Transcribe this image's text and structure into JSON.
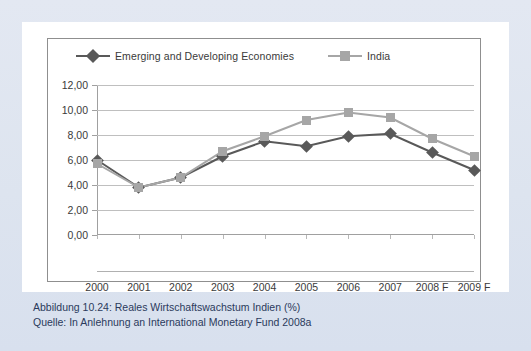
{
  "figure": {
    "caption_line1": "Abbildung 10.24:  Reales Wirtschaftswachstum Indien (%)",
    "caption_line2": "Quelle: In Anlehnung an International Monetary Fund 2008a"
  },
  "colors": {
    "series_emerging": "#595959",
    "series_india": "#a6a6a6",
    "gridline": "#bfbfbf",
    "axis": "#a0a0a0",
    "page_background": "#dfe5f0",
    "card_background": "#ffffff",
    "caption_text": "#2b3a5c"
  },
  "chart_data": {
    "type": "line",
    "title": "",
    "xlabel": "",
    "ylabel": "",
    "ylim": [
      0,
      12
    ],
    "yticks": [
      0,
      2,
      4,
      6,
      8,
      10,
      12
    ],
    "ytick_labels": [
      "0,00",
      "2,00",
      "4,00",
      "6,00",
      "8,00",
      "10,00",
      "12,00"
    ],
    "categories": [
      "2000",
      "2001",
      "2002",
      "2003",
      "2004",
      "2005",
      "2006",
      "2007",
      "2008 F",
      "2009 F"
    ],
    "grid": true,
    "legend_position": "top-left",
    "series": [
      {
        "name": "Emerging and Developing Economies",
        "color": "#595959",
        "marker": "diamond",
        "values": [
          6.0,
          3.8,
          4.6,
          6.3,
          7.5,
          7.1,
          7.9,
          8.1,
          6.6,
          5.2
        ]
      },
      {
        "name": "India",
        "color": "#a6a6a6",
        "marker": "square",
        "values": [
          5.7,
          3.8,
          4.6,
          6.7,
          7.9,
          9.2,
          9.8,
          9.4,
          7.7,
          6.3
        ]
      }
    ]
  }
}
